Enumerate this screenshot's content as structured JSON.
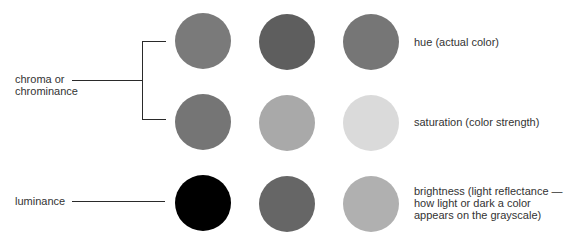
{
  "left_labels": {
    "chroma_line1": "chroma or",
    "chroma_line2": "chrominance",
    "luminance": "luminance"
  },
  "right_labels": {
    "hue": "hue (actual color)",
    "saturation": "saturation (color strength)",
    "brightness_line1": "brightness (light reflectance —",
    "brightness_line2": "how light or dark a color",
    "brightness_line3": "appears on the grayscale)"
  },
  "swatches": {
    "hue": [
      "#7a7a7a",
      "#5e5e5e",
      "#767676"
    ],
    "saturation": [
      "#757575",
      "#a9a9a9",
      "#dadada"
    ],
    "brightness": [
      "#000000",
      "#666666",
      "#b0b0b0"
    ]
  }
}
